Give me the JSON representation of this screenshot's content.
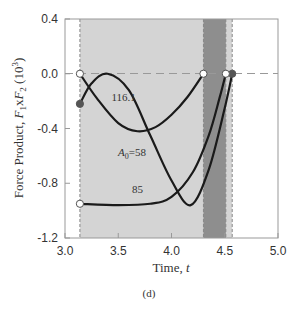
{
  "chart_data": {
    "type": "line",
    "title": "",
    "xlabel": "Time, t",
    "ylabel": "Force Product, F1xF2 (10^3)",
    "ylabel_parts": {
      "main": "Force Product, ",
      "f1": "F",
      "sub1": "1",
      "x": "x",
      "f2": "F",
      "sub2": "2",
      "unit": " (10",
      "exp": "3",
      "close": ")"
    },
    "caption": "(d)",
    "xlim": [
      3.0,
      5.0
    ],
    "ylim": [
      -1.2,
      0.4
    ],
    "x_ticks": [
      "3.0",
      "3.5",
      "4.0",
      "4.5",
      "5.0"
    ],
    "y_ticks": [
      "0.4",
      "0.0",
      "-0.4",
      "-0.8",
      "-1.2"
    ],
    "grid": false,
    "reference_line": {
      "y": 0.0,
      "style": "dashed"
    },
    "shaded_regions": [
      {
        "x0": 3.14,
        "x1": 4.57,
        "color": "#d4d4d4"
      },
      {
        "x0": 4.3,
        "x1": 4.51,
        "color": "#8e8e8e"
      }
    ],
    "series": [
      {
        "name": "A0=58",
        "label": "A₀=58",
        "x": [
          3.14,
          3.3,
          3.5,
          3.68,
          3.85,
          4.0,
          4.15,
          4.3
        ],
        "y": [
          0.0,
          -0.18,
          -0.36,
          -0.42,
          -0.39,
          -0.3,
          -0.17,
          0.0
        ],
        "start_marker": "open",
        "end_marker": "open"
      },
      {
        "name": "116.1",
        "label": "116.1",
        "x": [
          3.14,
          3.25,
          3.4,
          3.6,
          3.8,
          4.0,
          4.18,
          4.35,
          4.5,
          4.57
        ],
        "y": [
          -0.22,
          -0.07,
          0.0,
          -0.12,
          -0.45,
          -0.78,
          -0.96,
          -0.7,
          -0.25,
          0.0
        ],
        "start_marker": "filled",
        "end_marker": "filled"
      },
      {
        "name": "85",
        "label": "85",
        "x": [
          3.14,
          3.5,
          3.8,
          4.0,
          4.2,
          4.35,
          4.45,
          4.51
        ],
        "y": [
          -0.95,
          -0.96,
          -0.95,
          -0.9,
          -0.72,
          -0.45,
          -0.18,
          0.0
        ],
        "start_marker": "open",
        "end_marker": "open"
      }
    ],
    "annotations": [
      {
        "text": "116.1",
        "x": 3.55,
        "y": -0.2
      },
      {
        "text": "A0=58",
        "x": 3.63,
        "y": -0.6
      },
      {
        "text": "85",
        "x": 3.68,
        "y": -0.87
      }
    ]
  }
}
